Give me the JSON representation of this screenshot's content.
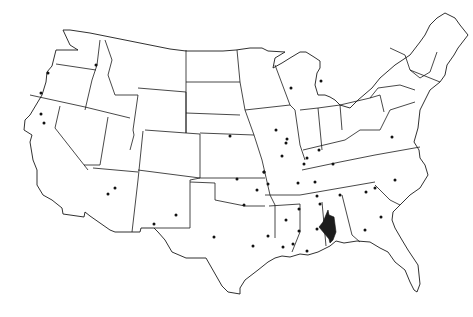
{
  "map": {
    "title": "United States map with marked locations",
    "region": "Contiguous United States",
    "style": {
      "background": "#ffffff",
      "outline_color": "#1a1a1a",
      "dot_color": "#111111",
      "highlight_color": "#1c1c1c"
    },
    "highlighted_region": {
      "description": "Southern Alabama / Mobile area (Gulf Coast)",
      "polygon": [
        [
          328,
          210
        ],
        [
          329,
          215
        ],
        [
          334,
          217
        ],
        [
          336,
          232
        ],
        [
          333,
          240
        ],
        [
          330,
          243
        ],
        [
          329,
          239
        ],
        [
          319,
          227
        ],
        [
          323,
          222
        ]
      ]
    },
    "dots": [
      [
        48,
        73
      ],
      [
        41,
        93
      ],
      [
        96,
        65
      ],
      [
        41,
        114
      ],
      [
        44,
        123
      ],
      [
        115,
        188
      ],
      [
        108,
        194
      ],
      [
        176,
        215
      ],
      [
        154,
        224
      ],
      [
        214,
        237
      ],
      [
        230,
        136
      ],
      [
        237,
        179
      ],
      [
        276,
        130
      ],
      [
        287,
        139
      ],
      [
        286,
        143
      ],
      [
        282,
        156
      ],
      [
        291,
        88
      ],
      [
        321,
        81
      ],
      [
        307,
        158
      ],
      [
        319,
        150
      ],
      [
        304,
        164
      ],
      [
        264,
        172
      ],
      [
        333,
        164
      ],
      [
        268,
        184
      ],
      [
        298,
        183
      ],
      [
        315,
        182
      ],
      [
        257,
        190
      ],
      [
        244,
        205
      ],
      [
        317,
        196
      ],
      [
        340,
        195
      ],
      [
        366,
        192
      ],
      [
        375,
        188
      ],
      [
        320,
        204
      ],
      [
        299,
        209
      ],
      [
        392,
        137
      ],
      [
        395,
        180
      ],
      [
        381,
        217
      ],
      [
        365,
        230
      ],
      [
        286,
        220
      ],
      [
        299,
        231
      ],
      [
        317,
        229
      ],
      [
        268,
        236
      ],
      [
        253,
        246
      ],
      [
        283,
        247
      ],
      [
        293,
        244
      ],
      [
        307,
        251
      ],
      [
        264,
        172
      ]
    ]
  }
}
